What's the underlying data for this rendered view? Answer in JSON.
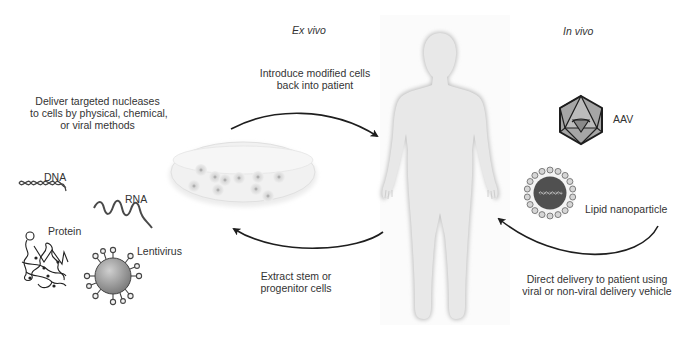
{
  "headings": {
    "ex_vivo": "Ex vivo",
    "in_vivo": "In vivo"
  },
  "steps": {
    "deliver_nucleases": [
      "Deliver targeted nucleases",
      "to cells by physical, chemical,",
      "or viral methods"
    ],
    "introduce_cells": [
      "Introduce modified cells",
      "back into patient"
    ],
    "extract_cells": [
      "Extract stem or",
      "progenitor cells"
    ],
    "direct_delivery": [
      "Direct delivery to patient using",
      "viral or non-viral delivery vehicle"
    ]
  },
  "cargo_types": {
    "dna": "DNA",
    "rna": "RNA",
    "protein": "Protein",
    "lentivirus": "Lentivirus"
  },
  "in_vivo_vehicles": {
    "aav": "AAV",
    "lipid_nanoparticle": "Lipid nanoparticle"
  },
  "colors": {
    "arrow": "#1e1e1e",
    "figure": "#e6e6e6",
    "figure_edge": "#bdbdbd",
    "dish": "#ededed",
    "particle_gray": "#9a9a9a",
    "lnp_core": "#555555"
  }
}
